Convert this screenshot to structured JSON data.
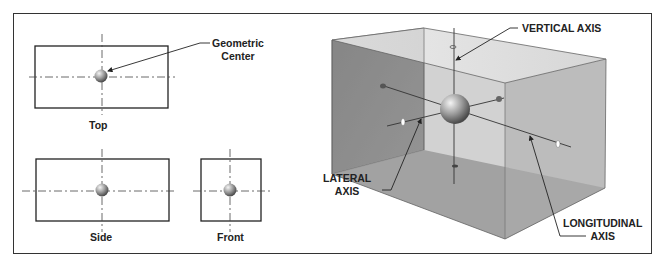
{
  "views": {
    "top": {
      "label": "Top"
    },
    "side": {
      "label": "Side"
    },
    "front": {
      "label": "Front"
    }
  },
  "callouts": {
    "geometric_center": {
      "line1": "Geometric",
      "line2": "Center"
    },
    "vertical_axis": {
      "label": "VERTICAL AXIS"
    },
    "lateral_axis": {
      "line1": "LATERAL",
      "line2": "AXIS"
    },
    "longitudinal_axis": {
      "line1": "LONGITUDINAL",
      "line2": "AXIS"
    }
  },
  "colors": {
    "frame": "#333333",
    "box_back": "#8f8f8f",
    "box_top": "#d8d8d8",
    "box_side": "#b3b3b3",
    "box_bottom": "#a5a5a5"
  }
}
